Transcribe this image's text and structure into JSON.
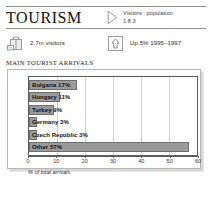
{
  "header": {
    "title": "TOURISM",
    "ratio_icon": "play-triangle-icon",
    "ratio_line1": "Visitors : population",
    "ratio_line2": "1:8.3"
  },
  "stats": [
    {
      "icon": "suitcase-icon",
      "label": "2.7m visitors"
    },
    {
      "icon": "up-arrow-box-icon",
      "label": "Up 5% 1995–1997"
    }
  ],
  "chart_data": {
    "type": "bar",
    "orientation": "horizontal",
    "title": "MAIN TOURIST ARRIVALS",
    "xlabel": "% of total arrivals",
    "ylabel": "",
    "xlim": [
      0,
      60
    ],
    "xticks": [
      0,
      10,
      20,
      30,
      40,
      50,
      60
    ],
    "xtick_labels": [
      "0",
      "10",
      "20",
      "30",
      "40",
      "50",
      "60"
    ],
    "grid": true,
    "legend": "none",
    "categories": [
      "Bulgaria",
      "Hungary",
      "Turkey",
      "Germany",
      "Czech Republic",
      "Other"
    ],
    "values": [
      17,
      11,
      9,
      3,
      3,
      57
    ],
    "bar_labels": [
      "Bulgaria 17%",
      "Hungary 11%",
      "Turkey 9%",
      "Germany 3%",
      "Czech Republic 3%",
      "Other 57%"
    ]
  },
  "colors": {
    "bar_fill": "#9a9a9a",
    "bar_stroke": "#6e6e6e",
    "rule": "#8e8e8e",
    "plot_border": "#5d5d5d",
    "gridline": "#cfcfcf",
    "shadow": "#d6d6d6"
  }
}
